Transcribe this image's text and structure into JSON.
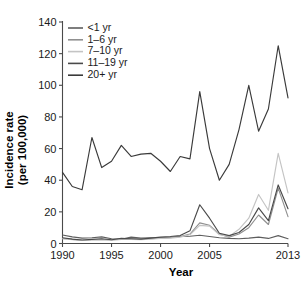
{
  "chart_data": {
    "type": "line",
    "title": "",
    "xlabel": "Year",
    "ylabel": "Incidence rate (per 100,000)",
    "ylabel_line1": "Incidence rate",
    "ylabel_line2": "(per 100,000)",
    "xlim": [
      1990,
      2013
    ],
    "ylim": [
      0,
      140
    ],
    "grid": false,
    "legend_position": "top-left",
    "xticks": [
      1990,
      1995,
      2000,
      2005,
      2013
    ],
    "xtick_labels": [
      "1990",
      "1995",
      "2000",
      "2005",
      "2013"
    ],
    "yticks": [
      0,
      20,
      40,
      60,
      80,
      100,
      120,
      140
    ],
    "ytick_labels": [
      "0",
      "20",
      "40",
      "60",
      "80",
      "100",
      "120",
      "140"
    ],
    "x": [
      1990,
      1991,
      1992,
      1993,
      1994,
      1995,
      1996,
      1997,
      1998,
      1999,
      2000,
      2001,
      2002,
      2003,
      2004,
      2005,
      2006,
      2007,
      2008,
      2009,
      2010,
      2011,
      2012,
      2013
    ],
    "series": [
      {
        "name": "<1 yr",
        "color": "#5e5e5e",
        "values": [
          5.4,
          4.2,
          3.4,
          3.6,
          4.2,
          3.0,
          2.6,
          4.0,
          3.4,
          3.6,
          3.6,
          3.8,
          4.4,
          4.6,
          5.2,
          4.4,
          3.6,
          3.2,
          3.0,
          3.4,
          4.0,
          3.2,
          5.0,
          3.0
        ]
      },
      {
        "name": "1–6 yr",
        "color": "#909090",
        "values": [
          3.2,
          2.6,
          2.0,
          2.4,
          2.6,
          2.2,
          3.0,
          2.8,
          2.6,
          3.0,
          3.4,
          3.6,
          4.4,
          6.0,
          13.0,
          11.5,
          6.0,
          4.0,
          6.0,
          10.0,
          18.0,
          12.0,
          35.0,
          17.0
        ]
      },
      {
        "name": "7–10 yr",
        "color": "#c4c4c4",
        "values": [
          3.0,
          2.4,
          2.0,
          2.2,
          2.4,
          2.0,
          2.6,
          2.6,
          2.4,
          2.8,
          3.2,
          3.4,
          4.0,
          5.5,
          11.5,
          11.0,
          5.5,
          4.5,
          9.0,
          16.0,
          31.0,
          21.0,
          57.0,
          32.0
        ]
      },
      {
        "name": "11–19 yr",
        "color": "#4a4a4a",
        "values": [
          3.6,
          2.8,
          2.2,
          2.6,
          3.0,
          2.4,
          3.2,
          3.0,
          2.8,
          3.4,
          4.0,
          4.4,
          5.0,
          8.0,
          24.5,
          16.0,
          6.5,
          5.0,
          7.0,
          12.0,
          22.5,
          14.5,
          37.0,
          22.0
        ]
      },
      {
        "name": "20+ yr",
        "color": "#3a3a3a",
        "values": [
          45.0,
          36.0,
          34.0,
          67.0,
          48.0,
          52.0,
          62.0,
          55.0,
          56.5,
          57.0,
          52.0,
          45.5,
          55.0,
          53.5,
          96.0,
          60.0,
          40.0,
          50.0,
          72.0,
          100.0,
          71.0,
          85.0,
          125.0,
          92.0
        ]
      }
    ]
  },
  "axes": {
    "x_title": "Year",
    "y_title_line1": "Incidence rate",
    "y_title_line2": "(per 100,000)"
  }
}
